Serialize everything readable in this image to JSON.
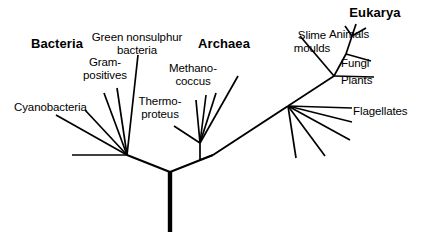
{
  "figure": {
    "kind": "phylogenetic-tree",
    "width": 421,
    "height": 242,
    "background_color": "#ffffff",
    "line_color": "#000000"
  },
  "domains": [
    {
      "id": "bacteria",
      "label": "Bacteria",
      "x": 22,
      "y": 38,
      "width": 70,
      "align": "center"
    },
    {
      "id": "archaea",
      "label": "Archaea",
      "x": 192,
      "y": 38,
      "width": 64,
      "align": "center"
    },
    {
      "id": "eukarya",
      "label": "Eukarya",
      "x": 340,
      "y": 7,
      "width": 70,
      "align": "center"
    }
  ],
  "taxa": [
    {
      "id": "green-nonsulphur-bacteria",
      "label": "Green nonsulphur\nbacteria",
      "x": 88,
      "y": 31,
      "width": 98,
      "align": "center"
    },
    {
      "id": "gram-positives",
      "label": "Gram-\npositives",
      "x": 79,
      "y": 56,
      "width": 52,
      "align": "center"
    },
    {
      "id": "cyanobacteria",
      "label": "Cyanobacteria",
      "x": 14,
      "y": 101,
      "width": 88,
      "align": "left"
    },
    {
      "id": "methanococcus",
      "label": "Methano-\ncoccus",
      "x": 163,
      "y": 62,
      "width": 60,
      "align": "center"
    },
    {
      "id": "thermoproteus",
      "label": "Thermo-\nproteus",
      "x": 131,
      "y": 95,
      "width": 58,
      "align": "center"
    },
    {
      "id": "slime-moulds",
      "label": "Slime\nmoulds",
      "x": 290,
      "y": 29,
      "width": 44,
      "align": "center"
    },
    {
      "id": "animals",
      "label": "Animals",
      "x": 329,
      "y": 28,
      "width": 52,
      "align": "left"
    },
    {
      "id": "fungi",
      "label": "Fungi",
      "x": 341,
      "y": 57,
      "width": 36,
      "align": "left"
    },
    {
      "id": "plants",
      "label": "Plants",
      "x": 341,
      "y": 74,
      "width": 40,
      "align": "left"
    },
    {
      "id": "flagellates",
      "label": "Flagellates",
      "x": 353,
      "y": 105,
      "width": 64,
      "align": "left"
    }
  ],
  "branches": [
    {
      "id": "root-trunk",
      "points": "170,232 170,172",
      "stroke_width": 4.4
    },
    {
      "id": "root-to-bacteria-node",
      "points": "170,172 127,155",
      "stroke_width": 2.0
    },
    {
      "id": "root-to-archaea-eukarya",
      "points": "170,172 213,155",
      "stroke_width": 2.0
    },
    {
      "id": "bacteria-basal-left",
      "points": "127,155 72,155",
      "stroke_width": 1.7
    },
    {
      "id": "bacteria-cyanobacteria",
      "points": "127,155 56,115",
      "stroke_width": 1.7
    },
    {
      "id": "bacteria-branch-b",
      "points": "127,155 85,110",
      "stroke_width": 1.7
    },
    {
      "id": "bacteria-gram-positives",
      "points": "127,155 104,93",
      "stroke_width": 1.7
    },
    {
      "id": "bacteria-branch-d",
      "points": "127,155 117,88",
      "stroke_width": 1.7
    },
    {
      "id": "bacteria-green-nonsulphur",
      "points": "127,155 138,55",
      "stroke_width": 1.7
    },
    {
      "id": "archaea-eukarya-split",
      "points": "213,155 200,160 200,143",
      "stroke_width": 1.7
    },
    {
      "id": "archaea-thermoproteus",
      "points": "200,143 174,126",
      "stroke_width": 1.7
    },
    {
      "id": "archaea-branch-b",
      "points": "200,143 196,100",
      "stroke_width": 1.7
    },
    {
      "id": "archaea-branch-c",
      "points": "200,143 206,95",
      "stroke_width": 1.7
    },
    {
      "id": "archaea-branch-d",
      "points": "200,143 216,93",
      "stroke_width": 1.7
    },
    {
      "id": "archaea-methanococcus",
      "points": "200,143 238,76",
      "stroke_width": 1.7
    },
    {
      "id": "eukarya-stem",
      "points": "213,155 288,106",
      "stroke_width": 2.0
    },
    {
      "id": "eukarya-basal-a",
      "points": "288,106 296,158",
      "stroke_width": 1.7
    },
    {
      "id": "eukarya-basal-b",
      "points": "288,106 325,156",
      "stroke_width": 1.7
    },
    {
      "id": "eukarya-basal-c",
      "points": "288,106 350,140",
      "stroke_width": 1.7
    },
    {
      "id": "eukarya-basal-d",
      "points": "288,106 352,122",
      "stroke_width": 1.7
    },
    {
      "id": "eukarya-flagellates",
      "points": "288,106 352,108",
      "stroke_width": 1.7
    },
    {
      "id": "eukarya-crown-stem",
      "points": "288,106 334,76",
      "stroke_width": 1.7
    },
    {
      "id": "eukarya-slime-moulds",
      "points": "334,76 300,36",
      "stroke_width": 1.7
    },
    {
      "id": "eukarya-plants",
      "points": "334,76 374,77",
      "stroke_width": 1.7
    },
    {
      "id": "eukarya-crown-upper",
      "points": "334,76 346,54",
      "stroke_width": 1.7
    },
    {
      "id": "eukarya-fungi",
      "points": "346,54 371,61",
      "stroke_width": 1.7
    },
    {
      "id": "eukarya-animals-stem",
      "points": "346,54 352,36",
      "stroke_width": 1.7
    },
    {
      "id": "eukarya-animals-a",
      "points": "352,36 345,26",
      "stroke_width": 1.7
    },
    {
      "id": "eukarya-animals-b",
      "points": "352,36 356,24",
      "stroke_width": 1.7
    },
    {
      "id": "eukarya-animals-c",
      "points": "352,36 366,28",
      "stroke_width": 1.7
    }
  ]
}
